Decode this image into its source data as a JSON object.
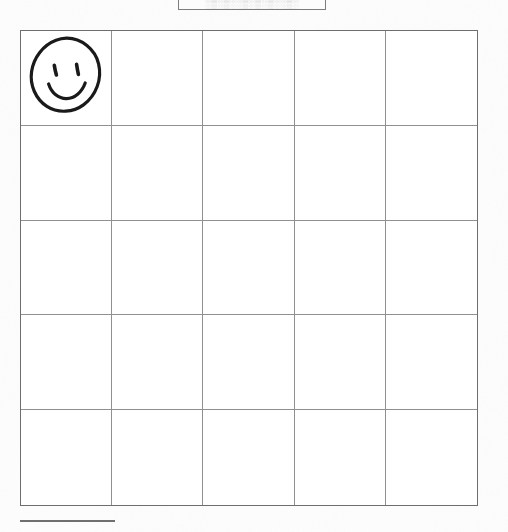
{
  "document": {
    "kind": "scanned-worksheet",
    "background_color": "#fdfdfd",
    "ink_color": "#1a1a1a",
    "grid_line_color": "#909090",
    "grid_border_color": "#6e6e6e"
  },
  "header_box": {
    "text": "",
    "illegible_text": "░▒░▒░░▒░▒░▒░░▒░",
    "note": "clipped faint text box",
    "border_color": "#7d7d7d"
  },
  "grid": {
    "columns": 5,
    "rows": 5,
    "cells": [
      [
        {
          "content": "smiley-face-drawing"
        },
        {
          "content": ""
        },
        {
          "content": ""
        },
        {
          "content": ""
        },
        {
          "content": ""
        }
      ],
      [
        {
          "content": ""
        },
        {
          "content": ""
        },
        {
          "content": ""
        },
        {
          "content": ""
        },
        {
          "content": ""
        }
      ],
      [
        {
          "content": ""
        },
        {
          "content": ""
        },
        {
          "content": ""
        },
        {
          "content": ""
        },
        {
          "content": ""
        }
      ],
      [
        {
          "content": ""
        },
        {
          "content": ""
        },
        {
          "content": ""
        },
        {
          "content": ""
        },
        {
          "content": ""
        }
      ],
      [
        {
          "content": ""
        },
        {
          "content": ""
        },
        {
          "content": ""
        },
        {
          "content": ""
        },
        {
          "content": ""
        }
      ]
    ]
  },
  "drawing": {
    "name": "smiley-face",
    "stroke_color": "#1a1a1a",
    "description": "hand drawn smiley face in first cell"
  },
  "bottom_rule": {
    "color": "#6f6f6f"
  }
}
